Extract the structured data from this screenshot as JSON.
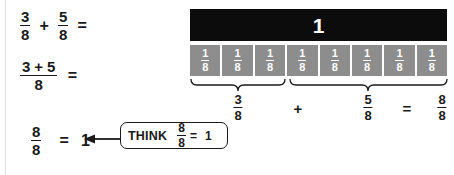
{
  "worksheet": {
    "title": "Adding fractions with like denominators",
    "steps": [
      {
        "id": "step-1",
        "left_numerator": "3",
        "left_denominator": "8",
        "operator": "+",
        "right_numerator": "5",
        "right_denominator": "8",
        "equals": "="
      },
      {
        "id": "step-2",
        "numerator_expression": "3",
        "numerator_plus": "+",
        "numerator_second": "5",
        "denominator": "8",
        "equals": "="
      },
      {
        "id": "step-3",
        "numerator": "8",
        "denominator": "8",
        "equals": "=",
        "result": "1"
      }
    ],
    "callout": {
      "label": "THINK",
      "numerator": "8",
      "denominator": "8",
      "equals": "=",
      "result": "1"
    }
  },
  "bar_model": {
    "whole_label": "1",
    "unit_numerator": "1",
    "unit_denominator": "8",
    "unit_count": 8,
    "units": [
      {
        "numerator": "1",
        "denominator": "8"
      },
      {
        "numerator": "1",
        "denominator": "8"
      },
      {
        "numerator": "1",
        "denominator": "8"
      },
      {
        "numerator": "1",
        "denominator": "8"
      },
      {
        "numerator": "1",
        "denominator": "8"
      },
      {
        "numerator": "1",
        "denominator": "8"
      },
      {
        "numerator": "1",
        "denominator": "8"
      },
      {
        "numerator": "1",
        "denominator": "8"
      }
    ],
    "groups": [
      {
        "name": "first-group",
        "span_units": 3,
        "numerator": "3",
        "denominator": "8"
      },
      {
        "name": "second-group",
        "span_units": 5,
        "numerator": "5",
        "denominator": "8"
      }
    ],
    "plus_symbol": "+",
    "equals_symbol": "=",
    "total": {
      "numerator": "8",
      "denominator": "8"
    }
  },
  "colors": {
    "whole_bar": "#0c0c0c",
    "unit_cell": "#8d8d8d",
    "text": "#1a1a1a",
    "unit_text": "#ffffff",
    "background": "#ffffff"
  }
}
